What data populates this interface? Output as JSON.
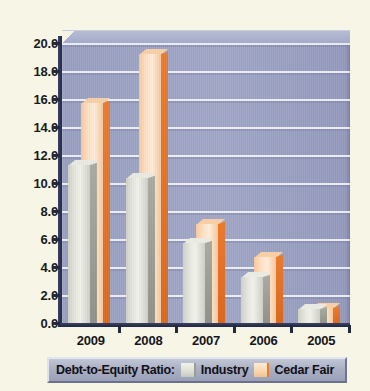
{
  "chart_data": {
    "type": "bar",
    "title": "",
    "subtitle": "",
    "xlabel": "",
    "ylabel": "",
    "categories": [
      "2009",
      "2008",
      "2007",
      "2006",
      "2005"
    ],
    "series": [
      {
        "name": "Industry",
        "color": "#e7e8e0",
        "values": [
          11.5,
          10.6,
          5.9,
          3.5,
          1.2
        ]
      },
      {
        "name": "Cedar Fair",
        "color": "#f3c79c",
        "values": [
          15.9,
          19.4,
          7.3,
          4.9,
          1.3
        ]
      }
    ],
    "ylim": [
      0.0,
      20.0
    ],
    "ytick_step": 2.0,
    "yticks": [
      "20.0",
      "18.0",
      "16.0",
      "14.0",
      "12.0",
      "10.0",
      "8.0",
      "6.0",
      "4.0",
      "2.0",
      "0.0"
    ],
    "grid": true,
    "legend_position": "bottom",
    "three_d": true
  },
  "legend": {
    "title": "Debt-to-Equity Ratio:",
    "entries": [
      {
        "label": "Industry"
      },
      {
        "label": "Cedar Fair"
      }
    ]
  },
  "colors": {
    "page_background": "#f7f5e6",
    "plot_background": "#9aa0c1",
    "gridline": "#ffffff",
    "axis": "#23293f",
    "industry_face": "#e7e8e0",
    "industry_side": "#9a9c92",
    "cedar_face": "#fadfc0",
    "cedar_side": "#e87b2c",
    "legend_background": "#aab0c4"
  }
}
